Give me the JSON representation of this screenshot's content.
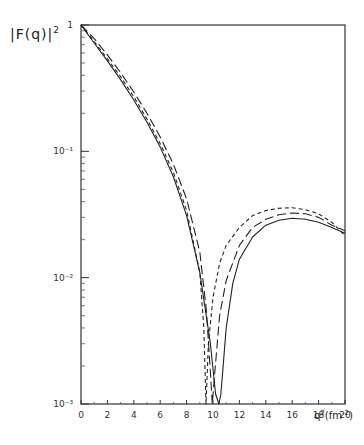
{
  "chart_data": {
    "type": "line",
    "title": "",
    "ylabel": "|F(q)|²",
    "xlabel": "q²(fm⁻²)",
    "yscale": "log",
    "xlim": [
      0,
      20
    ],
    "ylim": [
      0.001,
      1
    ],
    "x_ticks": [
      0,
      2,
      4,
      6,
      8,
      10,
      12,
      14,
      16,
      18,
      20
    ],
    "y_ticks": [
      {
        "value": 1,
        "label": "1"
      },
      {
        "value": 0.1,
        "label": "10⁻¹"
      },
      {
        "value": 0.01,
        "label": "10⁻²"
      },
      {
        "value": 0.001,
        "label": "10⁻³"
      }
    ],
    "grid": false,
    "legend": null,
    "series": [
      {
        "name": "solid",
        "style": "solid",
        "points": [
          [
            0,
            1.0
          ],
          [
            1,
            0.72
          ],
          [
            2,
            0.52
          ],
          [
            3,
            0.37
          ],
          [
            4,
            0.255
          ],
          [
            5,
            0.17
          ],
          [
            6,
            0.108
          ],
          [
            7,
            0.063
          ],
          [
            8,
            0.031
          ],
          [
            9,
            0.011
          ],
          [
            9.8,
            0.003
          ],
          [
            10.2,
            0.0012
          ],
          [
            10.45,
            0.001
          ],
          [
            10.6,
            0.0012
          ],
          [
            11,
            0.004
          ],
          [
            11.5,
            0.009
          ],
          [
            12,
            0.014
          ],
          [
            13,
            0.021
          ],
          [
            14,
            0.026
          ],
          [
            15,
            0.0285
          ],
          [
            16,
            0.0295
          ],
          [
            17,
            0.029
          ],
          [
            18,
            0.0275
          ],
          [
            19,
            0.025
          ],
          [
            20,
            0.0225
          ]
        ]
      },
      {
        "name": "long-dash",
        "style": "long-dash",
        "points": [
          [
            0,
            1.0
          ],
          [
            1,
            0.78
          ],
          [
            2,
            0.58
          ],
          [
            3,
            0.42
          ],
          [
            4,
            0.295
          ],
          [
            5,
            0.2
          ],
          [
            6,
            0.13
          ],
          [
            7,
            0.079
          ],
          [
            8,
            0.042
          ],
          [
            9,
            0.016
          ],
          [
            9.5,
            0.0055
          ],
          [
            9.8,
            0.0018
          ],
          [
            9.95,
            0.001
          ],
          [
            10.1,
            0.0016
          ],
          [
            10.5,
            0.005
          ],
          [
            11,
            0.0095
          ],
          [
            12,
            0.018
          ],
          [
            13,
            0.025
          ],
          [
            14,
            0.029
          ],
          [
            15,
            0.0315
          ],
          [
            16,
            0.0325
          ],
          [
            17,
            0.032
          ],
          [
            18,
            0.03
          ],
          [
            19,
            0.026
          ],
          [
            20,
            0.0235
          ]
        ]
      },
      {
        "name": "short-dash",
        "style": "short-dash",
        "points": [
          [
            0,
            1.0
          ],
          [
            1,
            0.74
          ],
          [
            2,
            0.54
          ],
          [
            3,
            0.39
          ],
          [
            4,
            0.27
          ],
          [
            5,
            0.18
          ],
          [
            6,
            0.115
          ],
          [
            7,
            0.068
          ],
          [
            8,
            0.034
          ],
          [
            9,
            0.011
          ],
          [
            9.3,
            0.004
          ],
          [
            9.47,
            0.001
          ],
          [
            9.65,
            0.003
          ],
          [
            10,
            0.007
          ],
          [
            10.5,
            0.013
          ],
          [
            11,
            0.018
          ],
          [
            12,
            0.025
          ],
          [
            13,
            0.031
          ],
          [
            14,
            0.034
          ],
          [
            15,
            0.0355
          ],
          [
            16,
            0.0357
          ],
          [
            17,
            0.0345
          ],
          [
            18,
            0.032
          ],
          [
            19,
            0.0275
          ],
          [
            20,
            0.0215
          ]
        ]
      }
    ]
  },
  "labels": {
    "y_axis_main": "|F(q)|",
    "y_axis_exp": "2",
    "x_axis_main": "q",
    "x_axis_exp": "2",
    "x_axis_unit_open": "(fm",
    "x_axis_unit_exp": "-2",
    "x_axis_unit_close": ")"
  }
}
